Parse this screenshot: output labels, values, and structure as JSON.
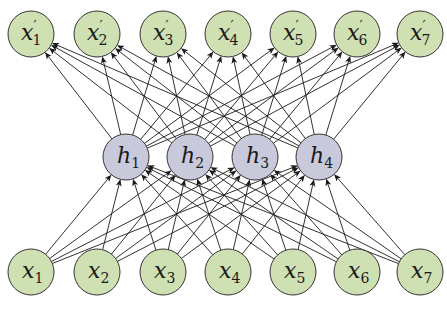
{
  "diagram": {
    "type": "autoencoder-neural-network",
    "colors": {
      "visible_fill": "#cfe0b2",
      "hidden_fill": "#c9c9dc",
      "stroke": "#333333",
      "edge": "#1a1a1a"
    },
    "node_radius": 23,
    "layers": {
      "output": {
        "y": 34,
        "nodes": [
          {
            "id": "o1",
            "base": "x",
            "prime": "′",
            "sub": "1",
            "x": 31
          },
          {
            "id": "o2",
            "base": "x",
            "prime": "′",
            "sub": "2",
            "x": 97
          },
          {
            "id": "o3",
            "base": "x",
            "prime": "′",
            "sub": "3",
            "x": 163
          },
          {
            "id": "o4",
            "base": "x",
            "prime": "′",
            "sub": "4",
            "x": 228
          },
          {
            "id": "o5",
            "base": "x",
            "prime": "′",
            "sub": "5",
            "x": 293
          },
          {
            "id": "o6",
            "base": "x",
            "prime": "′",
            "sub": "6",
            "x": 357
          },
          {
            "id": "o7",
            "base": "x",
            "prime": "′",
            "sub": "7",
            "x": 420
          }
        ]
      },
      "hidden": {
        "y": 157,
        "nodes": [
          {
            "id": "h1",
            "base": "h",
            "prime": "",
            "sub": "1",
            "x": 126
          },
          {
            "id": "h2",
            "base": "h",
            "prime": "",
            "sub": "2",
            "x": 190
          },
          {
            "id": "h3",
            "base": "h",
            "prime": "",
            "sub": "3",
            "x": 255
          },
          {
            "id": "h4",
            "base": "h",
            "prime": "",
            "sub": "4",
            "x": 319
          }
        ]
      },
      "input": {
        "y": 272,
        "nodes": [
          {
            "id": "i1",
            "base": "x",
            "prime": "",
            "sub": "1",
            "x": 31
          },
          {
            "id": "i2",
            "base": "x",
            "prime": "",
            "sub": "2",
            "x": 97
          },
          {
            "id": "i3",
            "base": "x",
            "prime": "",
            "sub": "3",
            "x": 163
          },
          {
            "id": "i4",
            "base": "x",
            "prime": "",
            "sub": "4",
            "x": 228
          },
          {
            "id": "i5",
            "base": "x",
            "prime": "",
            "sub": "5",
            "x": 293
          },
          {
            "id": "i6",
            "base": "x",
            "prime": "",
            "sub": "6",
            "x": 357
          },
          {
            "id": "i7",
            "base": "x",
            "prime": "",
            "sub": "7",
            "x": 420
          }
        ]
      }
    },
    "connections": [
      {
        "from": "input",
        "to": "hidden",
        "pattern": "fully-connected",
        "arrow": true
      },
      {
        "from": "hidden",
        "to": "output",
        "pattern": "fully-connected",
        "arrow": true
      }
    ]
  }
}
